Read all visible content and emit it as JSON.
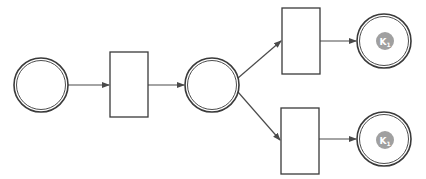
{
  "diagram": {
    "type": "petri-net",
    "colors": {
      "stroke": "#3a3a3a",
      "token": "#a0a0a0",
      "token_text": "#ffffff",
      "background": "#ffffff"
    },
    "places": [
      {
        "id": "p1",
        "cx": 41,
        "cy": 85,
        "r": 27,
        "token": null
      },
      {
        "id": "p2",
        "cx": 212,
        "cy": 85,
        "r": 27,
        "token": null
      },
      {
        "id": "p3",
        "cx": 384,
        "cy": 41,
        "r": 27,
        "token": {
          "label": "K",
          "subscript": "1"
        }
      },
      {
        "id": "p4",
        "cx": 384,
        "cy": 139,
        "r": 27,
        "token": {
          "label": "K",
          "subscript": "1"
        }
      }
    ],
    "transitions": [
      {
        "id": "t1",
        "x": 110,
        "y": 52,
        "w": 38,
        "h": 65
      },
      {
        "id": "t2",
        "x": 282,
        "y": 8,
        "w": 38,
        "h": 66
      },
      {
        "id": "t3",
        "x": 281,
        "y": 108,
        "w": 38,
        "h": 66
      }
    ],
    "arcs": [
      {
        "from": "p1",
        "to": "t1"
      },
      {
        "from": "t1",
        "to": "p2"
      },
      {
        "from": "p2",
        "to": "t2"
      },
      {
        "from": "p2",
        "to": "t3"
      },
      {
        "from": "t2",
        "to": "p3"
      },
      {
        "from": "t3",
        "to": "p4"
      }
    ]
  }
}
